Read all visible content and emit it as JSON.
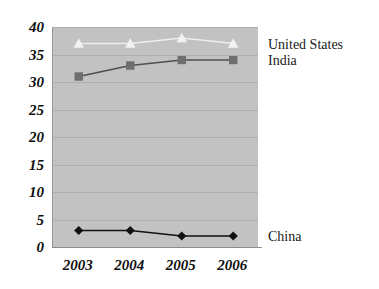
{
  "chart_data": {
    "type": "line",
    "title": "",
    "subtitle": "",
    "xlabel": "",
    "ylabel": "",
    "categories": [
      "2003",
      "2004",
      "2005",
      "2006"
    ],
    "ylim": [
      0,
      40
    ],
    "yticks": [
      0,
      5,
      10,
      15,
      20,
      25,
      30,
      35,
      40
    ],
    "ytick_labels": [
      "0",
      "5",
      "10",
      "15",
      "20",
      "25",
      "30",
      "35",
      "40"
    ],
    "grid": true,
    "legend_position": "right-inline",
    "plot_background": "#c2c2c2",
    "page_background": "#ffffff",
    "series": [
      {
        "name": "United States",
        "values": [
          37,
          37,
          38,
          37
        ],
        "color": "#f2f2f2",
        "line_color": "#ededed",
        "marker": "triangle"
      },
      {
        "name": "India",
        "values": [
          31,
          33,
          34,
          34
        ],
        "color": "#6e6e6e",
        "line_color": "#4f4f4f",
        "marker": "square"
      },
      {
        "name": "China",
        "values": [
          3,
          3,
          2,
          2
        ],
        "color": "#111111",
        "line_color": "#111111",
        "marker": "diamond"
      }
    ],
    "annotations": [
      {
        "text": "United States",
        "series": "United States",
        "value_at": 37
      },
      {
        "text": "India",
        "series": "India",
        "value_at": 34
      },
      {
        "text": "China",
        "series": "China",
        "value_at": 2
      }
    ]
  }
}
